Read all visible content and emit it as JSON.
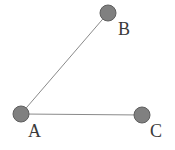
{
  "figure": {
    "type": "node-link-diagram",
    "width": 175,
    "height": 150,
    "background_color": "#ffffff",
    "node_fill_color": "#808080",
    "node_stroke_color": "#5e5e5e",
    "edge_color": "#8a8a8a",
    "label_color": "#3a3a3a",
    "node_radius": 8,
    "edge_width": 1
  },
  "nodes": [
    {
      "id": "A",
      "label": "A",
      "cx": 21,
      "cy": 114,
      "label_x": 28,
      "label_y": 122
    },
    {
      "id": "B",
      "label": "B",
      "cx": 108,
      "cy": 13,
      "label_x": 118,
      "label_y": 20
    },
    {
      "id": "C",
      "label": "C",
      "cx": 142,
      "cy": 115,
      "label_x": 150,
      "label_y": 122
    }
  ],
  "edges": [
    {
      "id": "A-B",
      "from": "A",
      "to": "B",
      "x1": 21,
      "y1": 114,
      "x2": 108,
      "y2": 13
    },
    {
      "id": "A-C",
      "from": "A",
      "to": "C",
      "x1": 21,
      "y1": 114,
      "x2": 142,
      "y2": 115
    }
  ]
}
